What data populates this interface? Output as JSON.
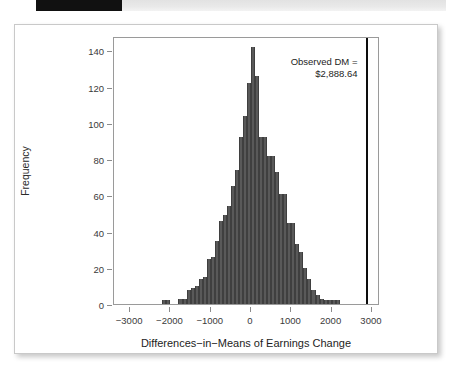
{
  "top_strip": {
    "black_block_label": "",
    "band_color": "#e9e9e9",
    "block_color": "#111111"
  },
  "figure": {
    "card_border_color": "#c9c9c9",
    "plot_border_color": "#9a9a9a"
  },
  "annotation": {
    "line1": "Observed DM =",
    "line2": "$2,888.64"
  },
  "chart_data": {
    "type": "bar",
    "title": "",
    "subtitle": "",
    "xlabel": "Differences−in−Means of Earnings Change",
    "ylabel": "Frequency",
    "xlim": [
      -3400,
      3200
    ],
    "ylim": [
      0,
      148
    ],
    "grid": false,
    "legend": null,
    "bar_color": "#595959",
    "bar_edge_color": "#3f3f3f",
    "xticks": [
      -3000,
      -2000,
      -1000,
      0,
      1000,
      2000,
      3000
    ],
    "xtick_labels": [
      "−3000",
      "−2000",
      "−1000",
      "0",
      "1000",
      "2000",
      "3000"
    ],
    "yticks": [
      0,
      20,
      40,
      60,
      80,
      100,
      120,
      140
    ],
    "ytick_labels": [
      "0",
      "20",
      "40",
      "60",
      "80",
      "100",
      "120",
      "140"
    ],
    "bin_width": 100,
    "bin_starts": [
      -2200,
      -2100,
      -2000,
      -1900,
      -1800,
      -1700,
      -1600,
      -1500,
      -1400,
      -1300,
      -1200,
      -1100,
      -1000,
      -900,
      -800,
      -700,
      -600,
      -500,
      -400,
      -300,
      -200,
      -100,
      0,
      100,
      200,
      300,
      400,
      500,
      600,
      700,
      800,
      900,
      1000,
      1100,
      1200,
      1300,
      1400,
      1500,
      1600,
      1700,
      1800,
      1900,
      2000,
      2100
    ],
    "values": [
      2,
      2,
      0,
      0,
      3,
      3,
      8,
      9,
      10,
      14,
      15,
      25,
      26,
      35,
      46,
      49,
      54,
      65,
      74,
      92,
      104,
      122,
      142,
      126,
      92,
      92,
      82,
      82,
      73,
      61,
      61,
      45,
      45,
      33,
      29,
      20,
      14,
      8,
      5,
      3,
      2,
      2,
      2,
      2
    ],
    "annotations": [
      {
        "label": "Observed DM = $2,888.64",
        "x": 2888.64,
        "type": "vertical-line",
        "color": "#0d0d0d"
      }
    ]
  }
}
